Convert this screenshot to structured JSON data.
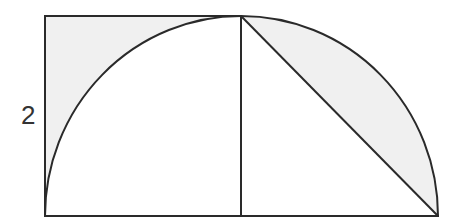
{
  "diagram": {
    "side_label": "2",
    "colors": {
      "stroke": "#2a2a2a",
      "shade": "#f0f0f0",
      "background": "#ffffff",
      "label": "#333333"
    },
    "shapes": {
      "square": {
        "x": 45,
        "y": 16,
        "size": 196
      },
      "left_arc": {
        "center": [
          241,
          216
        ],
        "radius": 196,
        "from": [
          45,
          216
        ],
        "to": [
          241,
          16
        ]
      },
      "right_quarter_circle": {
        "center": [
          241,
          216
        ],
        "radius": 197,
        "from": [
          241,
          16
        ],
        "to": [
          438,
          216
        ]
      },
      "chord": {
        "from": [
          241,
          16
        ],
        "to": [
          438,
          216
        ]
      },
      "baseline": {
        "from": [
          45,
          216
        ],
        "to": [
          438,
          216
        ]
      }
    },
    "shaded_regions": [
      "corner region between square and left arc",
      "circular segment between right arc and chord"
    ]
  }
}
